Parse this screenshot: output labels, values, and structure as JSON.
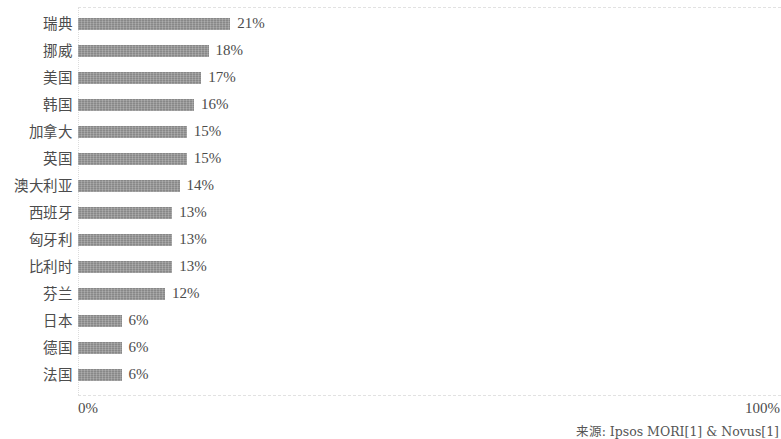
{
  "chart_data": {
    "type": "bar",
    "orientation": "horizontal",
    "title": "",
    "subtitle": "",
    "xlabel": "",
    "ylabel": "",
    "xlim": [
      0,
      100
    ],
    "grid": true,
    "legend": null,
    "categories": [
      "瑞典",
      "挪威",
      "美国",
      "韩国",
      "加拿大",
      "英国",
      "澳大利亚",
      "西班牙",
      "匈牙利",
      "比利时",
      "芬兰",
      "日本",
      "德国",
      "法国"
    ],
    "values": [
      21,
      18,
      17,
      16,
      15,
      15,
      14,
      13,
      13,
      13,
      12,
      6,
      6,
      6
    ],
    "data_labels": [
      "21%",
      "18%",
      "17%",
      "16%",
      "15%",
      "15%",
      "14%",
      "13%",
      "13%",
      "13%",
      "12%",
      "6%",
      "6%",
      "6%"
    ],
    "x_tick_labels": [
      "0%",
      "100%"
    ],
    "bar_color": "#8f8f8f",
    "annotations": [
      "来源: Ipsos MORI[1] & Novus[1]"
    ]
  },
  "axis": {
    "min_label": "0%",
    "max_label": "100%"
  },
  "source": {
    "text": "来源: Ipsos MORI[1] & Novus[1]"
  },
  "rows": [
    {
      "label": "瑞典",
      "value": 21,
      "display": "21%"
    },
    {
      "label": "挪威",
      "value": 18,
      "display": "18%"
    },
    {
      "label": "美国",
      "value": 17,
      "display": "17%"
    },
    {
      "label": "韩国",
      "value": 16,
      "display": "16%"
    },
    {
      "label": "加拿大",
      "value": 15,
      "display": "15%"
    },
    {
      "label": "英国",
      "value": 15,
      "display": "15%"
    },
    {
      "label": "澳大利亚",
      "value": 14,
      "display": "14%"
    },
    {
      "label": "西班牙",
      "value": 13,
      "display": "13%"
    },
    {
      "label": "匈牙利",
      "value": 13,
      "display": "13%"
    },
    {
      "label": "比利时",
      "value": 13,
      "display": "13%"
    },
    {
      "label": "芬兰",
      "value": 12,
      "display": "12%"
    },
    {
      "label": "日本",
      "value": 6,
      "display": "6%"
    },
    {
      "label": "德国",
      "value": 6,
      "display": "6%"
    },
    {
      "label": "法国",
      "value": 6,
      "display": "6%"
    }
  ]
}
